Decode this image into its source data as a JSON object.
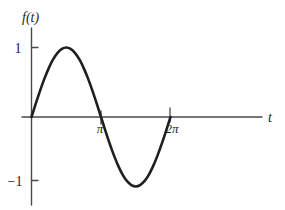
{
  "chart_data": {
    "type": "line",
    "title": "",
    "subtitle": "",
    "xlabel": "t",
    "ylabel": "f(t)",
    "function": "sin(t)",
    "xlim": [
      -0.35,
      8.6
    ],
    "ylim": [
      -1.55,
      1.45
    ],
    "grid": false,
    "legend": null,
    "x_ticks": [
      {
        "value": 3.14159,
        "label": "π"
      },
      {
        "value": 6.28319,
        "label": "2π"
      }
    ],
    "y_ticks": [
      {
        "value": 1,
        "label": "1"
      },
      {
        "value": -1,
        "label": "−1"
      }
    ],
    "series": [
      {
        "name": "f(t) = sin(t)",
        "color": "#1f1f1f",
        "x": [
          0.0,
          0.19635,
          0.3927,
          0.58905,
          0.7854,
          0.98175,
          1.1781,
          1.37445,
          1.5708,
          1.76715,
          1.9635,
          2.15984,
          2.35619,
          2.55254,
          2.74889,
          2.94524,
          3.14159,
          3.33794,
          3.53429,
          3.73064,
          3.92699,
          4.12334,
          4.31969,
          4.51604,
          4.71239,
          4.90874,
          5.10509,
          5.30144,
          5.49779,
          5.69414,
          5.89049,
          6.08684,
          6.28319
        ],
        "y": [
          0.0,
          0.19509,
          0.38268,
          0.55557,
          0.70711,
          0.83147,
          0.92388,
          0.98079,
          1.0,
          0.98079,
          0.92388,
          0.83147,
          0.70711,
          0.55557,
          0.38268,
          0.19509,
          0.0,
          -0.19509,
          -0.38268,
          -0.55557,
          -0.70711,
          -0.83147,
          -0.92388,
          -0.98079,
          -1.0,
          -0.98079,
          -0.92388,
          -0.83147,
          -0.70711,
          -0.55557,
          -0.38268,
          -0.19509,
          0.0
        ]
      }
    ],
    "annotations": [],
    "colors": {
      "curve": "#1f1f1f",
      "axis": "#4a4a4a",
      "background": "#ffffff"
    }
  },
  "figure": {
    "y_axis_label": "f(t)",
    "x_axis_label": "t",
    "y_tick_top_label": "1",
    "y_tick_bottom_label": "−1",
    "x_tick_pi_label": "π",
    "x_tick_2pi_label": "2π"
  }
}
